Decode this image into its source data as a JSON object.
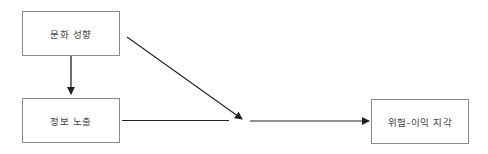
{
  "diagram": {
    "nodes": [
      {
        "id": "cultural_orientation",
        "label": "문화 성향"
      },
      {
        "id": "information_exposure",
        "label": "정보 노출"
      },
      {
        "id": "risk_benefit_perception",
        "label": "위험-이익 지각"
      }
    ],
    "edges": [
      {
        "from": "cultural_orientation",
        "to": "information_exposure",
        "type": "direct"
      },
      {
        "from": "cultural_orientation",
        "to": "path:information_exposure->risk_benefit_perception",
        "type": "moderation"
      },
      {
        "from": "information_exposure",
        "to": "risk_benefit_perception",
        "type": "direct"
      }
    ],
    "colors": {
      "line": "#222222",
      "box_border": "#8a8a8a",
      "text": "#444444"
    }
  }
}
